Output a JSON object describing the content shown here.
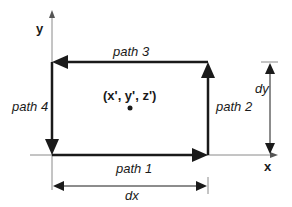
{
  "diagram": {
    "axes": {
      "x_label": "x",
      "y_label": "y"
    },
    "paths": [
      {
        "id": "path1",
        "label": "path 1",
        "direction": "right",
        "edge": "bottom"
      },
      {
        "id": "path2",
        "label": "path 2",
        "direction": "up",
        "edge": "right"
      },
      {
        "id": "path3",
        "label": "path 3",
        "direction": "left",
        "edge": "top"
      },
      {
        "id": "path4",
        "label": "path 4",
        "direction": "down",
        "edge": "left"
      }
    ],
    "point": {
      "label": "(x', y', z')"
    },
    "dimensions": {
      "dx_label": "dx",
      "dy_label": "dy"
    },
    "colors": {
      "line": "#1a1a1a",
      "axis": "#888888"
    }
  }
}
